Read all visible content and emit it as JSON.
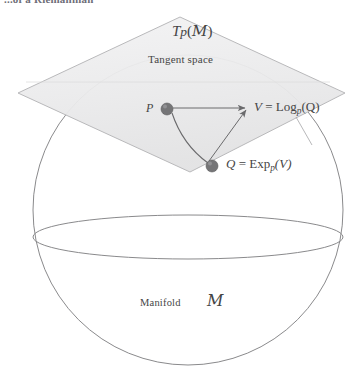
{
  "figure": {
    "title_fragment": "...of a Riemannian",
    "tangent_plane": {
      "symbol_T": "T",
      "symbol_p": "p",
      "symbol_open": "(",
      "symbol_M": "M",
      "symbol_close": ")",
      "caption": "Tangent space"
    },
    "points": {
      "p_label": "P",
      "q_label": "Q"
    },
    "equations": {
      "log_map": {
        "lhs": "V",
        "eq": " = ",
        "op": "Log",
        "sub": "p",
        "arg": "(Q)"
      },
      "exp_map": {
        "lhs": "Q",
        "eq": " = ",
        "op": "Exp",
        "sub": "p",
        "arg": "(V)"
      }
    },
    "manifold": {
      "caption": "Manifold",
      "symbol": "M"
    },
    "colors": {
      "plane_fill": "#ececed",
      "plane_stroke": "#b9b9bb",
      "sphere_stroke": "#8a8a8c",
      "arrow_stroke": "#6a6a6c",
      "dot_fill": "#757577",
      "text": "#454545"
    }
  }
}
